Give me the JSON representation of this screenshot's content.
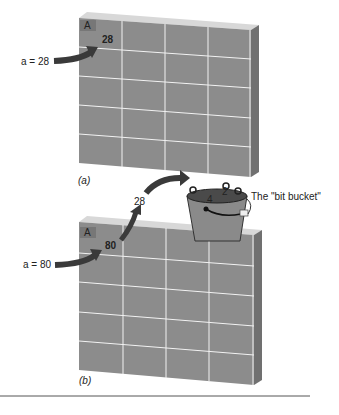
{
  "figure": {
    "panel_a": {
      "caption": "(a)",
      "cell_label": "A",
      "cell_value": "28",
      "assignment": "a = 28",
      "rows": 5,
      "cols": 4
    },
    "panel_b": {
      "caption": "(b)",
      "cell_label": "A",
      "cell_value": "80",
      "assignment": "a = 80",
      "discarded_value": "28",
      "rows": 5,
      "cols": 4
    },
    "bucket": {
      "label": "The \"bit bucket\"",
      "digits": [
        "4",
        "2"
      ]
    }
  },
  "colors": {
    "cell_fill": "#8c8c8c",
    "grid_line": "#f2f2f2",
    "top_edge": "#d8d8d8",
    "side_edge": "#6e6e6e",
    "label_box": "#7a7a7a",
    "arrow": "#3a3a3a",
    "bucket": "#8a8a8a",
    "rule": "#555555"
  }
}
